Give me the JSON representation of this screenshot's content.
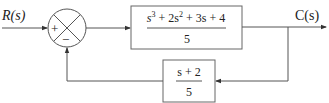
{
  "diagram": {
    "type": "feedback-control-block-diagram",
    "input": {
      "label": "R(s)"
    },
    "output": {
      "label": "C(s)"
    },
    "summing_junction": {
      "signs": {
        "input": "+",
        "feedback": "−"
      }
    },
    "forward_block": {
      "numerator": {
        "terms": [
          "s",
          "3",
          " + 2s",
          "2",
          " + 3s + 4"
        ]
      },
      "denominator": "5"
    },
    "feedback_block": {
      "numerator": "s + 2",
      "denominator": "5"
    }
  },
  "colors": {
    "line": "#555555",
    "text": "#222222"
  }
}
